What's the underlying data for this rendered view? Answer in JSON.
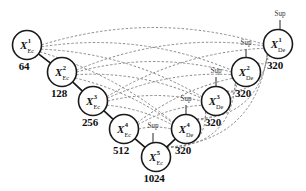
{
  "figure": {
    "type": "network-diagram"
  },
  "nodes": [
    {
      "id": "x1ec",
      "base": "X",
      "sup": "1",
      "sub": "Ec",
      "value": "64",
      "cx": 27,
      "cy": 45,
      "r": 14.5,
      "value_dx": -3,
      "value_dy": 16,
      "sup_label": null
    },
    {
      "id": "x2ec",
      "base": "X",
      "sup": "2",
      "sub": "Ec",
      "value": "128",
      "cx": 62,
      "cy": 72,
      "r": 14.5,
      "value_dx": -3,
      "value_dy": 16,
      "sup_label": null
    },
    {
      "id": "x3ec",
      "base": "X",
      "sup": "3",
      "sub": "Ec",
      "value": "256",
      "cx": 93,
      "cy": 101,
      "r": 14.5,
      "value_dx": -3,
      "value_dy": 16,
      "sup_label": null
    },
    {
      "id": "x4ec",
      "base": "X",
      "sup": "4",
      "sub": "Ec",
      "value": "512",
      "cx": 124,
      "cy": 129,
      "r": 14.5,
      "value_dx": -3,
      "value_dy": 16,
      "sup_label": null
    },
    {
      "id": "x5ec",
      "base": "X",
      "sup": "5",
      "sub": "Ec",
      "value": "1024",
      "cx": 156,
      "cy": 157,
      "r": 14.5,
      "value_dx": -2,
      "value_dy": 16,
      "sup_label": "Sup"
    },
    {
      "id": "x4de",
      "base": "X",
      "sup": "4",
      "sub": "De",
      "value": "320",
      "cx": 186,
      "cy": 129,
      "r": 14.5,
      "value_dx": -3,
      "value_dy": 16,
      "sup_label": "Sup"
    },
    {
      "id": "x3de",
      "base": "X",
      "sup": "3",
      "sub": "De",
      "value": "320",
      "cx": 216,
      "cy": 101,
      "r": 14.5,
      "value_dx": -3,
      "value_dy": 16,
      "sup_label": "Sup"
    },
    {
      "id": "x2de",
      "base": "X",
      "sup": "2",
      "sub": "De",
      "value": "320",
      "cx": 246,
      "cy": 72,
      "r": 14.5,
      "value_dx": -3,
      "value_dy": 16,
      "sup_label": "Sup"
    },
    {
      "id": "x1de",
      "base": "X",
      "sup": "1",
      "sub": "De",
      "value": "320",
      "cx": 278,
      "cy": 44,
      "r": 14.5,
      "value_dx": -3,
      "value_dy": 16,
      "sup_label": "Sup"
    }
  ],
  "sup_labels": [
    {
      "for": "x5ec",
      "text": "Sup",
      "x": 153,
      "y": 127,
      "stem_x": 153,
      "stem_y1": 133,
      "stem_y2": 143
    },
    {
      "for": "x4de",
      "text": "Sup",
      "x": 186,
      "y": 100,
      "stem_x": 186,
      "stem_y1": 105,
      "stem_y2": 115
    },
    {
      "for": "x3de",
      "text": "Sup",
      "x": 216,
      "y": 72,
      "stem_x": 216,
      "stem_y1": 77,
      "stem_y2": 87
    },
    {
      "for": "x2de",
      "text": "Sup",
      "x": 246,
      "y": 44,
      "stem_x": 246,
      "stem_y1": 49,
      "stem_y2": 58
    },
    {
      "for": "x1de",
      "text": "Sup",
      "x": 280,
      "y": 15,
      "stem_x": 280,
      "stem_y1": 20,
      "stem_y2": 30
    }
  ],
  "chain_edges": [
    {
      "from": "x1ec",
      "to": "x2ec"
    },
    {
      "from": "x2ec",
      "to": "x3ec"
    },
    {
      "from": "x3ec",
      "to": "x4ec"
    },
    {
      "from": "x4ec",
      "to": "x5ec"
    },
    {
      "from": "x5ec",
      "to": "x4de"
    }
  ],
  "skip_edges": [
    {
      "from": "x1ec",
      "to": "x1de",
      "bow": -34
    },
    {
      "from": "x1ec",
      "to": "x2de",
      "bow": -27
    },
    {
      "from": "x1ec",
      "to": "x3de",
      "bow": -21
    },
    {
      "from": "x1ec",
      "to": "x4de",
      "bow": -15
    },
    {
      "from": "x2ec",
      "to": "x1de",
      "bow": -26
    },
    {
      "from": "x2ec",
      "to": "x2de",
      "bow": -21
    },
    {
      "from": "x2ec",
      "to": "x3de",
      "bow": -16
    },
    {
      "from": "x2ec",
      "to": "x4de",
      "bow": -11
    },
    {
      "from": "x3ec",
      "to": "x1de",
      "bow": -21
    },
    {
      "from": "x3ec",
      "to": "x2de",
      "bow": -16
    },
    {
      "from": "x3ec",
      "to": "x3de",
      "bow": -11
    },
    {
      "from": "x3ec",
      "to": "x4de",
      "bow": -7
    },
    {
      "from": "x4ec",
      "to": "x2de",
      "bow": -12
    },
    {
      "from": "x4ec",
      "to": "x3de",
      "bow": -8
    },
    {
      "from": "x4ec",
      "to": "x4de",
      "bow": -4
    },
    {
      "from": "x4de",
      "to": "x3de",
      "bow": 10
    },
    {
      "from": "x4de",
      "to": "x2de",
      "bow": 24
    },
    {
      "from": "x4de",
      "to": "x1de",
      "bow": 40
    },
    {
      "from": "x3de",
      "to": "x2de",
      "bow": 12
    },
    {
      "from": "x3de",
      "to": "x1de",
      "bow": 26
    },
    {
      "from": "x2de",
      "to": "x1de",
      "bow": 13
    },
    {
      "from": "x5ec",
      "to": "x3de",
      "bow": 30
    },
    {
      "from": "x5ec",
      "to": "x2de",
      "bow": 44
    },
    {
      "from": "x5ec",
      "to": "x1de",
      "bow": 56
    }
  ],
  "colors": {
    "node_stroke": "#1a1a1a",
    "node_fill": "#ffffff",
    "chain_edge": "#1a1a1a",
    "skip_edge": "#8a8a8a",
    "text": "#111111",
    "sup_text": "#3a3a3a",
    "background": "#ffffff"
  }
}
